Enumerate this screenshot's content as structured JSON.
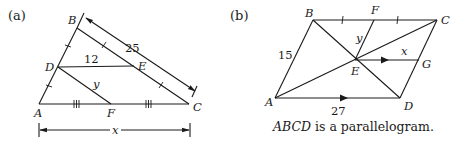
{
  "figure_a": {
    "part_label": "(a)",
    "points": {
      "A": "A",
      "B": "B",
      "C": "C",
      "D": "D",
      "E": "E",
      "F": "F"
    },
    "labels": {
      "de_length": "12",
      "bc_length": "25",
      "df_length": "y",
      "ac_length": "x"
    }
  },
  "figure_b": {
    "part_label": "(b)",
    "points": {
      "A": "A",
      "B": "B",
      "C": "C",
      "D": "D",
      "E": "E",
      "F": "F",
      "G": "G"
    },
    "labels": {
      "ab_length": "15",
      "ad_length": "27",
      "ef_length": "y",
      "eg_length": "x"
    },
    "caption_italic": "ABCD",
    "caption_rest": " is a parallelogram."
  }
}
